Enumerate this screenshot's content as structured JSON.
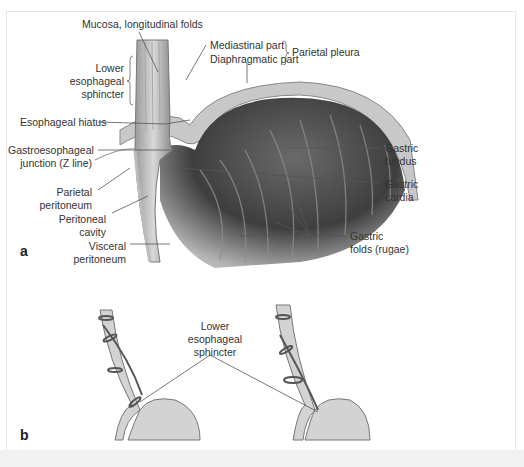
{
  "figure": {
    "panel_a": {
      "letter": "a",
      "labels": {
        "mucosa": "Mucosa, longitudinal folds",
        "les_line1": "Lower",
        "les_line2": "esophageal",
        "les_line3": "sphincter",
        "mediastinal": "Mediastinal part",
        "diaphragmatic": "Diaphragmatic part",
        "parietal_pleura": "Parietal pleura",
        "hiatus": "Esophageal hiatus",
        "gej_line1": "Gastroesophageal",
        "gej_line2": "junction (Z line)",
        "parietal_perit_line1": "Parietal",
        "parietal_perit_line2": "peritoneum",
        "peritoneal_cavity_line1": "Peritoneal",
        "peritoneal_cavity_line2": "cavity",
        "visceral_perit_line1": "Visceral",
        "visceral_perit_line2": "peritoneum",
        "fundus_line1": "Gastric",
        "fundus_line2": "fundus",
        "cardia_line1": "Gastric",
        "cardia_line2": "cardia",
        "rugae_line1": "Gastric",
        "rugae_line2": "folds (rugae)"
      }
    },
    "panel_b": {
      "letter": "b",
      "labels": {
        "les_line1": "Lower",
        "les_line2": "esophageal",
        "les_line3": "sphincter"
      }
    },
    "colors": {
      "tissue_fill": "#cfcfcf",
      "tissue_dark": "#4a4a4a",
      "leader_line": "#555555",
      "text": "#333333"
    }
  }
}
